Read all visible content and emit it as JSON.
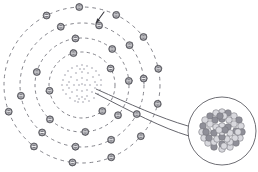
{
  "figure": {
    "width": 258,
    "height": 172,
    "background_color": "#ffffff"
  },
  "colors": {
    "orbit_stroke": "#6e6e76",
    "electron_fill": "#78787f",
    "electron_stroke": "#4a4a50",
    "electron_sign": "#ffffff",
    "nucleus_dot": "#c9c9cf",
    "inset_outline": "#5d5d64",
    "inset_nucleon_light": "#d8d8dd",
    "inset_nucleon_dark": "#8f8f98",
    "connector_stroke": "#55555c",
    "pointer_stroke": "#3a3a40"
  },
  "atom": {
    "label": "electron-shell-diagram",
    "center": {
      "x": 82,
      "y": 85
    },
    "nucleus": {
      "label": "nucleus-dot-cloud",
      "radius": 20,
      "dot_count": 54,
      "dot_radius": 1.1,
      "dots": [
        [
          82,
          65
        ],
        [
          87,
          66
        ],
        [
          77,
          66
        ],
        [
          92,
          68
        ],
        [
          72,
          68
        ],
        [
          96,
          71
        ],
        [
          68,
          71
        ],
        [
          99,
          75
        ],
        [
          65,
          75
        ],
        [
          101,
          80
        ],
        [
          63,
          80
        ],
        [
          101,
          85
        ],
        [
          62,
          85
        ],
        [
          100,
          90
        ],
        [
          63,
          90
        ],
        [
          98,
          94
        ],
        [
          66,
          94
        ],
        [
          94,
          98
        ],
        [
          70,
          98
        ],
        [
          89,
          101
        ],
        [
          75,
          101
        ],
        [
          83,
          102
        ],
        [
          78,
          102
        ],
        [
          82,
          72
        ],
        [
          88,
          73
        ],
        [
          76,
          73
        ],
        [
          93,
          77
        ],
        [
          71,
          77
        ],
        [
          95,
          82
        ],
        [
          69,
          82
        ],
        [
          95,
          88
        ],
        [
          69,
          88
        ],
        [
          92,
          92
        ],
        [
          72,
          92
        ],
        [
          87,
          96
        ],
        [
          77,
          96
        ],
        [
          82,
          97
        ],
        [
          82,
          78
        ],
        [
          87,
          80
        ],
        [
          77,
          80
        ],
        [
          90,
          85
        ],
        [
          74,
          85
        ],
        [
          87,
          90
        ],
        [
          77,
          90
        ],
        [
          82,
          91
        ],
        [
          82,
          84
        ],
        [
          85,
          85
        ],
        [
          79,
          85
        ],
        [
          84,
          69
        ],
        [
          80,
          69
        ],
        [
          97,
          85
        ],
        [
          67,
          85
        ],
        [
          85,
          99
        ],
        [
          79,
          99
        ]
      ]
    },
    "orbits": [
      {
        "name": "shell-1",
        "radius": 33,
        "electron_count": 4,
        "dash": "3.2 3.2"
      },
      {
        "name": "shell-2",
        "radius": 47,
        "electron_count": 7,
        "dash": "3.2 3.4"
      },
      {
        "name": "shell-3",
        "radius": 62,
        "electron_count": 9,
        "dash": "3.4 3.6"
      },
      {
        "name": "shell-4",
        "radius": 78,
        "electron_count": 11,
        "dash": "3.6 3.8"
      }
    ],
    "electron": {
      "label": "electron",
      "symbol": "−",
      "radius": 3.5,
      "inner_radius": 2.2,
      "stem_length": 4
    },
    "electron_positions": [
      {
        "shell": 0,
        "angle": 255
      },
      {
        "shell": 0,
        "angle": 330
      },
      {
        "shell": 0,
        "angle": 52
      },
      {
        "shell": 0,
        "angle": 170
      },
      {
        "shell": 1,
        "angle": 262
      },
      {
        "shell": 1,
        "angle": 310
      },
      {
        "shell": 1,
        "angle": 355
      },
      {
        "shell": 1,
        "angle": 40
      },
      {
        "shell": 1,
        "angle": 86
      },
      {
        "shell": 1,
        "angle": 133
      },
      {
        "shell": 1,
        "angle": 196
      },
      {
        "shell": 2,
        "angle": 250
      },
      {
        "shell": 2,
        "angle": 286
      },
      {
        "shell": 2,
        "angle": 320
      },
      {
        "shell": 2,
        "angle": 354
      },
      {
        "shell": 2,
        "angle": 28
      },
      {
        "shell": 2,
        "angle": 62
      },
      {
        "shell": 2,
        "angle": 96
      },
      {
        "shell": 2,
        "angle": 130
      },
      {
        "shell": 2,
        "angle": 170
      },
      {
        "shell": 3,
        "angle": 243
      },
      {
        "shell": 3,
        "angle": 268
      },
      {
        "shell": 3,
        "angle": 296
      },
      {
        "shell": 3,
        "angle": 322
      },
      {
        "shell": 3,
        "angle": 348
      },
      {
        "shell": 3,
        "angle": 14
      },
      {
        "shell": 3,
        "angle": 41
      },
      {
        "shell": 3,
        "angle": 68
      },
      {
        "shell": 3,
        "angle": 97
      },
      {
        "shell": 3,
        "angle": 128
      },
      {
        "shell": 3,
        "angle": 160
      }
    ],
    "pointer": {
      "label": "electron-pointer-arrow",
      "from": {
        "x": 104,
        "y": 12
      },
      "to": {
        "x": 96,
        "y": 23
      }
    }
  },
  "inset": {
    "label": "magnified-nucleus-inset",
    "center": {
      "x": 222,
      "y": 131
    },
    "radius": 34,
    "nucleus_radius": 20,
    "nucleon_radius": 3.3,
    "nucleon_count": 46,
    "nucleons": [
      [
        222,
        112,
        "light"
      ],
      [
        228,
        113,
        "dark"
      ],
      [
        216,
        113,
        "light"
      ],
      [
        234,
        116,
        "light"
      ],
      [
        210,
        116,
        "dark"
      ],
      [
        239,
        120,
        "dark"
      ],
      [
        205,
        120,
        "light"
      ],
      [
        241,
        126,
        "light"
      ],
      [
        203,
        126,
        "dark"
      ],
      [
        242,
        132,
        "dark"
      ],
      [
        202,
        132,
        "light"
      ],
      [
        240,
        138,
        "light"
      ],
      [
        204,
        138,
        "light"
      ],
      [
        236,
        143,
        "dark"
      ],
      [
        208,
        143,
        "light"
      ],
      [
        230,
        147,
        "light"
      ],
      [
        214,
        147,
        "dark"
      ],
      [
        222,
        149,
        "light"
      ],
      [
        222,
        119,
        "dark"
      ],
      [
        229,
        120,
        "light"
      ],
      [
        215,
        120,
        "dark"
      ],
      [
        234,
        124,
        "light"
      ],
      [
        210,
        124,
        "light"
      ],
      [
        236,
        131,
        "dark"
      ],
      [
        208,
        131,
        "light"
      ],
      [
        235,
        138,
        "light"
      ],
      [
        209,
        138,
        "dark"
      ],
      [
        230,
        142,
        "light"
      ],
      [
        214,
        142,
        "light"
      ],
      [
        222,
        144,
        "dark"
      ],
      [
        222,
        126,
        "light"
      ],
      [
        228,
        127,
        "dark"
      ],
      [
        216,
        127,
        "light"
      ],
      [
        230,
        133,
        "light"
      ],
      [
        214,
        133,
        "dark"
      ],
      [
        227,
        139,
        "light"
      ],
      [
        217,
        139,
        "light"
      ],
      [
        222,
        137,
        "dark"
      ],
      [
        222,
        132,
        "light"
      ],
      [
        225,
        130,
        "dark"
      ],
      [
        219,
        130,
        "light"
      ],
      [
        224,
        116,
        "light"
      ],
      [
        220,
        116,
        "dark"
      ],
      [
        238,
        132,
        "light"
      ],
      [
        206,
        132,
        "dark"
      ],
      [
        224,
        146,
        "light"
      ]
    ]
  },
  "connector": {
    "label": "magnifier-connector",
    "upper_path": "M 96 89 C 130 104 160 118 188 126",
    "lower_path": "M 95 93 C 132 112 162 128 189 136"
  }
}
